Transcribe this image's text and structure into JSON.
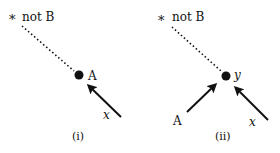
{
  "panels": [
    {
      "caption": "(i)",
      "star_label": "not B",
      "node_label": "A",
      "arrows": [
        {
          "label": "x"
        }
      ]
    },
    {
      "caption": "(ii)",
      "star_label": "not B",
      "node_label": "y",
      "arrows": [
        {
          "label": "A"
        },
        {
          "label": "x"
        }
      ]
    }
  ],
  "colors": {
    "ink": "#111111",
    "background": "#ffffff"
  }
}
